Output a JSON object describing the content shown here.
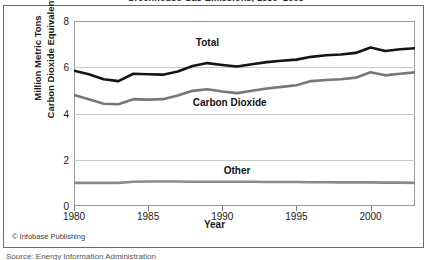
{
  "figure": {
    "title_clipped": "Greenhouse Gas Emissions, 1980–2003",
    "credit": "© Infobase Publishing",
    "caption_clipped": "Source: Energy Information Administration"
  },
  "colors": {
    "total_line": "#141414",
    "carbon_dioxide_line": "#777777",
    "other_line": "#8a8a8a",
    "gridline": "#c9c9c9",
    "axis": "#9a9a9a",
    "frame": "#6b6b6b",
    "text": "#1a1a1a",
    "background": "#ffffff"
  },
  "chart_data": {
    "type": "line",
    "title": "Greenhouse Gas Emissions, 1980–2003",
    "xlabel": "Year",
    "ylabel": "Million Metric Tons Carbon Dioxide Equivalent",
    "ylabel_lines": [
      "Million Metric Tons",
      "Carbon Dioxide Equivalent"
    ],
    "xlim": [
      1980,
      2003
    ],
    "ylim": [
      0,
      8
    ],
    "yticks": [
      0,
      2,
      4,
      6,
      8
    ],
    "ytick_labels": [
      "0",
      "2",
      "4",
      "6",
      "8"
    ],
    "xticks": [
      1980,
      1985,
      1990,
      1995,
      2000
    ],
    "xtick_labels": [
      "1980",
      "1985",
      "1990",
      "1995",
      "2000"
    ],
    "grid": "horizontal",
    "legend": "inline-labels",
    "x": [
      1980,
      1981,
      1982,
      1983,
      1984,
      1985,
      1986,
      1987,
      1988,
      1989,
      1990,
      1991,
      1992,
      1993,
      1994,
      1995,
      1996,
      1997,
      1998,
      1999,
      2000,
      2001,
      2002,
      2003
    ],
    "series": [
      {
        "name": "Total",
        "color": "#141414",
        "width": 2.6,
        "label_text": "Total",
        "label_x": 1989.0,
        "label_y": 7.05,
        "values": [
          5.85,
          5.7,
          5.48,
          5.4,
          5.72,
          5.7,
          5.68,
          5.82,
          6.05,
          6.18,
          6.1,
          6.03,
          6.13,
          6.22,
          6.28,
          6.33,
          6.45,
          6.52,
          6.55,
          6.62,
          6.85,
          6.7,
          6.78,
          6.82
        ]
      },
      {
        "name": "Carbon Dioxide",
        "color": "#777777",
        "width": 2.6,
        "label_text": "Carbon Dioxide",
        "label_x": 1990.5,
        "label_y": 4.45,
        "values": [
          4.8,
          4.62,
          4.42,
          4.4,
          4.62,
          4.6,
          4.62,
          4.78,
          4.98,
          5.05,
          4.95,
          4.88,
          4.98,
          5.08,
          5.15,
          5.22,
          5.4,
          5.45,
          5.48,
          5.55,
          5.78,
          5.65,
          5.72,
          5.78
        ]
      },
      {
        "name": "Other",
        "color": "#8a8a8a",
        "width": 2.6,
        "label_text": "Other",
        "label_x": 1991.0,
        "label_y": 1.52,
        "values": [
          1.0,
          1.0,
          1.0,
          1.0,
          1.05,
          1.06,
          1.06,
          1.06,
          1.05,
          1.05,
          1.05,
          1.05,
          1.05,
          1.04,
          1.04,
          1.04,
          1.03,
          1.03,
          1.02,
          1.02,
          1.02,
          1.01,
          1.01,
          1.0
        ]
      }
    ]
  }
}
